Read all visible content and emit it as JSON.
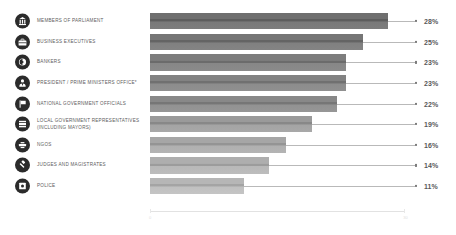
{
  "chart_data": {
    "type": "bar",
    "orientation": "horizontal",
    "title": "",
    "subtitle": "",
    "xlabel": "",
    "ylabel": "",
    "xlim": [
      0,
      30
    ],
    "grid": false,
    "legend": "none",
    "value_suffix": "%",
    "axis_ticks": [
      "0",
      "30"
    ],
    "categories": [
      "MEMBERS OF PARLIAMENT",
      "BUSINESS EXECUTIVES",
      "BANKERS",
      "PRESIDENT / PRIME MINISTERS OFFICE*",
      "NATIONAL GOVERNMENT OFFICIALS",
      "LOCAL GOVERNMENT REPRESENTATIVES\n(INCLUDING MAYORS)",
      "NGOs",
      "JUDGES AND MAGISTRATES",
      "POLICE"
    ],
    "values": [
      28,
      25,
      23,
      23,
      22,
      19,
      16,
      14,
      11
    ],
    "value_labels": [
      "28%",
      "25%",
      "23%",
      "23%",
      "22%",
      "19%",
      "16%",
      "14%",
      "11%"
    ],
    "bar_colors": [
      "#6f6f6f",
      "#767676",
      "#7d7d7d",
      "#828282",
      "#888888",
      "#9a9a9a",
      "#a6a6a6",
      "#aeaeae",
      "#b6b6b6"
    ],
    "icons": [
      "parliament-icon",
      "briefcase-icon",
      "bank-coin-icon",
      "person-tie-icon",
      "flag-icon",
      "city-hall-icon",
      "handshake-icon",
      "gavel-icon",
      "police-badge-icon"
    ]
  }
}
